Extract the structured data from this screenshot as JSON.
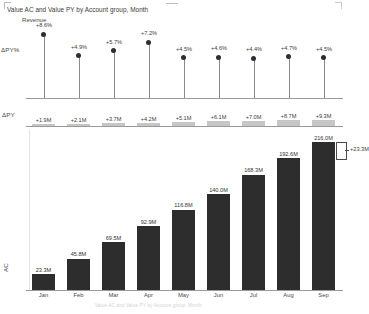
{
  "header": {
    "title": "Value AC and Value PY by Account group, Month",
    "legend": "Revenue"
  },
  "labels": {
    "delta_py_pct": "ΔPY%",
    "delta_py": "ΔPY",
    "value_axis": "AC",
    "footer_note": "Value AC and Value PY by Account group, Month"
  },
  "annotation": {
    "delta_last": "+23.3M"
  },
  "chart_data": {
    "type": "bar",
    "title": "Value AC and Value PY by Account group, Month",
    "subtitle": "Revenue",
    "xlabel": "Month",
    "ylabel": "AC",
    "ylim": [
      0,
      216
    ],
    "grid": false,
    "legend_position": "top-left",
    "categories": [
      "Jan",
      "Feb",
      "Mar",
      "Apr",
      "May",
      "Jun",
      "Jul",
      "Aug",
      "Sep"
    ],
    "series": [
      {
        "name": "AC",
        "unit": "M",
        "values": [
          23.3,
          45.8,
          69.5,
          92.9,
          116.8,
          140.0,
          168.3,
          192.6,
          216.0
        ],
        "labels": [
          "23.3M",
          "45.8M",
          "69.5M",
          "92.9M",
          "116.8M",
          "140.0M",
          "168.3M",
          "192.6M",
          "216.0M"
        ]
      },
      {
        "name": "ΔPY",
        "unit": "M",
        "values": [
          1.9,
          2.1,
          3.7,
          4.2,
          5.1,
          6.1,
          7.0,
          8.7,
          9.3
        ],
        "labels": [
          "+1.9M",
          "+2.1M",
          "+3.7M",
          "+4.2M",
          "+5.1M",
          "+6.1M",
          "+7.0M",
          "+8.7M",
          "+9.3M"
        ]
      },
      {
        "name": "ΔPY%",
        "unit": "%",
        "values": [
          8.6,
          4.9,
          5.7,
          7.2,
          4.5,
          4.6,
          4.4,
          4.7,
          4.5
        ],
        "labels": [
          "+8.6%",
          "+4.9%",
          "+5.7%",
          "+7.2%",
          "+4.5%",
          "+4.6%",
          "+4.4%",
          "+4.7%",
          "+4.5%"
        ]
      }
    ]
  },
  "colors": {
    "bar": "#2d2d2d",
    "delta_bar": "#c6c6c6",
    "axis": "#9a9a9a",
    "dot": "#2e2e2e",
    "stem": "#8a8a8a"
  }
}
